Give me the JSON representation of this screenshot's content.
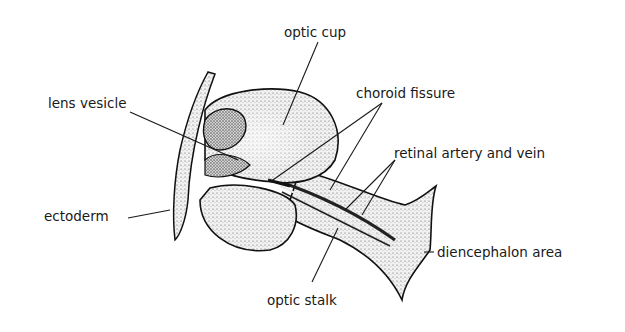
{
  "figure": {
    "colors": {
      "background": "#ffffff",
      "ink": "#1a1a1a",
      "stipple": "#555555"
    }
  },
  "labels": {
    "optic_cup": "optic cup",
    "lens_vesicle": "lens vesicle",
    "choroid_fissure": "choroid fissure",
    "retinal_artery_and_vein": "retinal artery and vein",
    "ectoderm": "ectoderm",
    "diencephalon_area": "diencephalon area",
    "optic_stalk": "optic stalk"
  }
}
